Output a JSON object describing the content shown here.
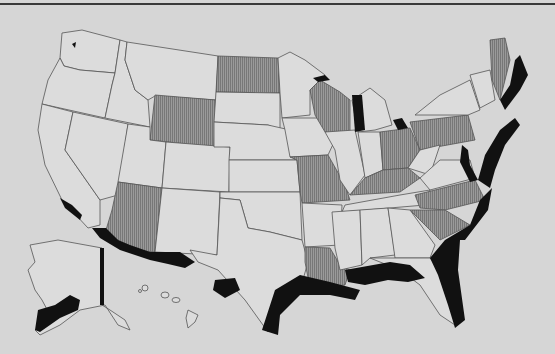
{
  "map": {
    "title": "",
    "type": "choropleth",
    "region": "United States (with Alaska and Hawaii)",
    "colors": {
      "background": "#d6d6d6",
      "state_fill": "#dcdcdc",
      "shaded_state": "#8c8c8c",
      "coastal_zone": "#111111",
      "border": "#555555"
    },
    "legend": {
      "shaded_states": [
        "North Dakota",
        "Wyoming",
        "Wisconsin",
        "Missouri",
        "Arizona",
        "Kentucky",
        "Ohio",
        "Pennsylvania",
        "North Carolina",
        "South Carolina",
        "Louisiana",
        "Maine"
      ],
      "black_zones": "coastal regions (Pacific, Gulf, Atlantic, Great Lakes, Alaska)"
    }
  }
}
